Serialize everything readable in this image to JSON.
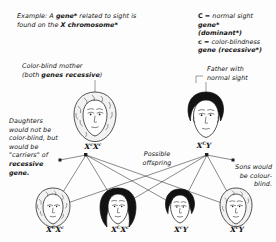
{
  "diagram": {
    "example_note": {
      "line1_plain_a": "Example: A ",
      "line1_bold_a": "gene*",
      "line1_plain_b": " related to sight",
      "line2_plain_a": "is found on the ",
      "line2_bold_a": "X chromosome*"
    },
    "legend": {
      "dominant_symbol": "C",
      "dominant_eq": " = normal sight ",
      "dominant_gene": "gene*",
      "dominant_qualifier": "(dominant*)",
      "recessive_symbol": "c",
      "recessive_eq": " = color-blindness",
      "recessive_gene": "gene (recessive*)"
    },
    "mother_note": {
      "line1": "Color-blind mother",
      "line2_plain_a": "(both ",
      "line2_bold": "genes recessive",
      "line2_plain_b": ")"
    },
    "father_note": {
      "line1": "Father with",
      "line2": "normal sight"
    },
    "daughters_note": {
      "line1": "Daughters",
      "line2": "would not be",
      "line3": "color-blind, but",
      "line4": "would be",
      "line5": "\"carriers\" of",
      "line6_bold": "recessive",
      "line7_bold": "gene."
    },
    "offspring_note": {
      "line1": "Possible",
      "line2": "offspring"
    },
    "sons_note": {
      "line1": "Sons would",
      "line2": "be colour-",
      "line3": "blind."
    },
    "genotypes": {
      "mother": {
        "x1": "X",
        "sup1": "c",
        "x2": "X",
        "sup2": "c"
      },
      "father": {
        "x1": "X",
        "sup1": "C",
        "x2": "Y",
        "sup2": ""
      },
      "child1": {
        "x1": "X",
        "sup1": "C",
        "x2": "X",
        "sup2": "c"
      },
      "child2": {
        "x1": "X",
        "sup1": "C",
        "x2": "X",
        "sup2": "c"
      },
      "child3": {
        "x1": "X",
        "sup1": "c",
        "x2": "Y",
        "sup2": ""
      },
      "child4": {
        "x1": "X",
        "sup1": "c",
        "x2": "Y",
        "sup2": ""
      }
    },
    "people": {
      "mother_label": "color-blind mother portrait",
      "father_label": "normal sight father portrait",
      "child1_label": "daughter carrier portrait",
      "child2_label": "daughter carrier portrait",
      "child3_label": "son colour-blind portrait",
      "child4_label": "son colour-blind portrait"
    },
    "colors": {
      "ink": "#1a1a1a",
      "line": "#2a2a2a",
      "hair_dark": "#121212",
      "hair_light": "#f2f2f2",
      "background": "#fdfdfd"
    }
  }
}
